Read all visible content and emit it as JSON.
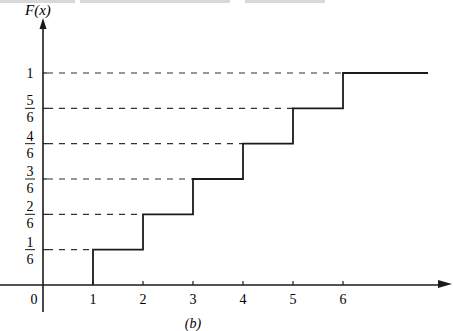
{
  "chart_data": {
    "type": "line",
    "subtype": "step",
    "title": "",
    "caption": "(b)",
    "xlabel": "",
    "ylabel": "F(x)",
    "x_ticks": [
      "1",
      "2",
      "3",
      "4",
      "5",
      "6"
    ],
    "x_tick_values": [
      1,
      2,
      3,
      4,
      5,
      6
    ],
    "origin_label": "0",
    "y_ticks": [
      {
        "value": 0.1667,
        "num": "1",
        "den": "6"
      },
      {
        "value": 0.3333,
        "num": "2",
        "den": "6"
      },
      {
        "value": 0.5,
        "num": "3",
        "den": "6"
      },
      {
        "value": 0.6667,
        "num": "4",
        "den": "6"
      },
      {
        "value": 0.8333,
        "num": "5",
        "den": "6"
      },
      {
        "value": 1.0,
        "label": "1"
      }
    ],
    "series": [
      {
        "name": "F(x)",
        "steps": [
          {
            "x_start": 1,
            "x_end": 2,
            "y": 0.1667
          },
          {
            "x_start": 2,
            "x_end": 3,
            "y": 0.3333
          },
          {
            "x_start": 3,
            "x_end": 4,
            "y": 0.5
          },
          {
            "x_start": 4,
            "x_end": 5,
            "y": 0.6667
          },
          {
            "x_start": 5,
            "x_end": 6,
            "y": 0.8333
          },
          {
            "x_start": 6,
            "x_end": 7.7,
            "y": 1.0
          }
        ]
      }
    ],
    "xlim": [
      -0.9,
      7.2
    ],
    "ylim": [
      0,
      1
    ],
    "grid": false,
    "reference_lines": "dashed horizontal lines from y-axis to each step level",
    "line_color": "#1a1a1a"
  }
}
